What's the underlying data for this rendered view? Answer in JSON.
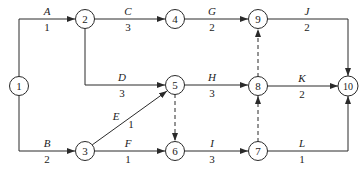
{
  "diagram": {
    "type": "activity-on-arrow network",
    "nodes": [
      {
        "id": "1",
        "label": "1",
        "x": 19,
        "y": 86
      },
      {
        "id": "2",
        "label": "2",
        "x": 85,
        "y": 19
      },
      {
        "id": "3",
        "label": "3",
        "x": 85,
        "y": 151
      },
      {
        "id": "4",
        "label": "4",
        "x": 175,
        "y": 19
      },
      {
        "id": "5",
        "label": "5",
        "x": 175,
        "y": 85
      },
      {
        "id": "6",
        "label": "6",
        "x": 175,
        "y": 151
      },
      {
        "id": "7",
        "label": "7",
        "x": 258,
        "y": 151
      },
      {
        "id": "8",
        "label": "8",
        "x": 258,
        "y": 86
      },
      {
        "id": "9",
        "label": "9",
        "x": 258,
        "y": 19
      },
      {
        "id": "10",
        "label": "10",
        "x": 348,
        "y": 86
      }
    ],
    "activities": [
      {
        "name": "A",
        "duration": "1",
        "from": "1",
        "to": "2"
      },
      {
        "name": "B",
        "duration": "2",
        "from": "1",
        "to": "3"
      },
      {
        "name": "C",
        "duration": "3",
        "from": "2",
        "to": "4"
      },
      {
        "name": "D",
        "duration": "3",
        "from": "2",
        "to": "5"
      },
      {
        "name": "E",
        "duration": "1",
        "from": "3",
        "to": "5"
      },
      {
        "name": "F",
        "duration": "1",
        "from": "3",
        "to": "6"
      },
      {
        "name": "G",
        "duration": "2",
        "from": "4",
        "to": "9"
      },
      {
        "name": "H",
        "duration": "3",
        "from": "5",
        "to": "8"
      },
      {
        "name": "I",
        "duration": "3",
        "from": "6",
        "to": "7"
      },
      {
        "name": "J",
        "duration": "2",
        "from": "9",
        "to": "10"
      },
      {
        "name": "K",
        "duration": "2",
        "from": "8",
        "to": "10"
      },
      {
        "name": "L",
        "duration": "1",
        "from": "7",
        "to": "10"
      }
    ],
    "dummies": [
      {
        "from": "5",
        "to": "6"
      },
      {
        "from": "7",
        "to": "8"
      },
      {
        "from": "8",
        "to": "9"
      }
    ]
  }
}
